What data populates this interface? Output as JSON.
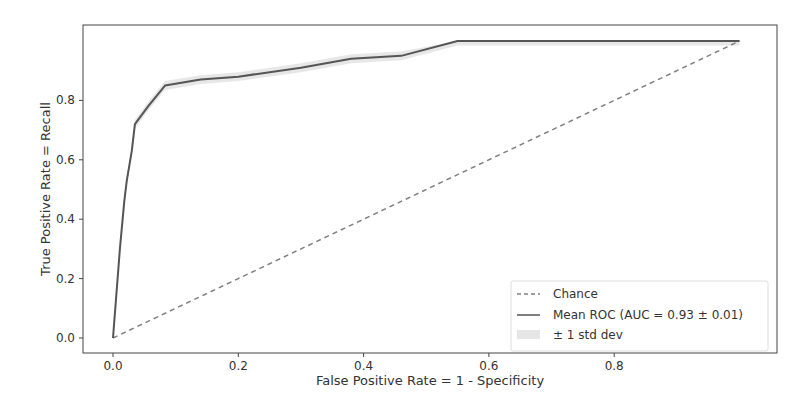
{
  "chart_data": {
    "type": "line",
    "title": "",
    "xlabel": "False Positive Rate = 1 - Specificity",
    "ylabel": "True Positive Rate = Recall",
    "xlim": [
      -0.05,
      1.05
    ],
    "ylim": [
      -0.05,
      1.05
    ],
    "xticks": [
      "0.0",
      "0.2",
      "0.4",
      "0.6",
      "0.8"
    ],
    "yticks": [
      "0.0",
      "0.2",
      "0.4",
      "0.6",
      "0.8"
    ],
    "grid": false,
    "legend_position": "lower right",
    "series": [
      {
        "name": "Chance",
        "style": "dashed",
        "color": "#808080",
        "x": [
          0,
          1
        ],
        "y": [
          0,
          1
        ]
      },
      {
        "name": "Mean ROC (AUC = 0.93 ± 0.01)",
        "style": "solid",
        "color": "#555555",
        "x": [
          0,
          0.011,
          0.018,
          0.022,
          0.03,
          0.035,
          0.056,
          0.083,
          0.14,
          0.2,
          0.3,
          0.38,
          0.46,
          0.55,
          0.7,
          0.85,
          1.0
        ],
        "y": [
          0,
          0.3,
          0.46,
          0.53,
          0.63,
          0.72,
          0.78,
          0.85,
          0.87,
          0.88,
          0.91,
          0.94,
          0.95,
          1.0,
          1.0,
          1.0,
          1.0
        ]
      },
      {
        "name": "± 1 std dev",
        "style": "band",
        "color": "#dddddd",
        "half_width": 0.015
      }
    ]
  },
  "legend": {
    "items": [
      {
        "label": "Chance"
      },
      {
        "label": "Mean ROC (AUC = 0.93 ± 0.01)"
      },
      {
        "label": "± 1 std dev"
      }
    ]
  }
}
